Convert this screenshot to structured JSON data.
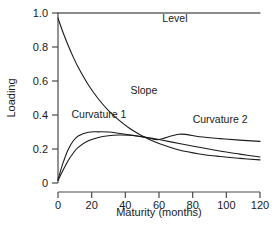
{
  "chart_data": {
    "type": "line",
    "title": "",
    "xlabel": "Maturity (months)",
    "ylabel": "Loading",
    "xlim": [
      0,
      120
    ],
    "ylim": [
      0,
      1.0
    ],
    "xticks": [
      0,
      20,
      40,
      60,
      80,
      100,
      120
    ],
    "xticklabels": [
      "0",
      "20",
      "40",
      "60",
      "80",
      "100",
      "120"
    ],
    "yticks": [
      0,
      0.2,
      0.4,
      0.6,
      0.8,
      1.0
    ],
    "yticklabels": [
      "0",
      "0.2",
      "0.4",
      "0.6",
      "0.8",
      "1.0"
    ],
    "grid": false,
    "legend": "inline-annotations",
    "line_color": "#1a1a1a",
    "x": [
      0,
      3,
      6,
      9,
      12,
      18,
      24,
      30,
      36,
      42,
      48,
      54,
      60,
      72,
      84,
      96,
      108,
      120
    ],
    "series": [
      {
        "name": "Level",
        "label": "Level",
        "label_x": 62,
        "label_y": 0.945,
        "values": [
          1.0,
          1.0,
          1.0,
          1.0,
          1.0,
          1.0,
          1.0,
          1.0,
          1.0,
          1.0,
          1.0,
          1.0,
          1.0,
          1.0,
          1.0,
          1.0,
          1.0,
          1.0
        ]
      },
      {
        "name": "Slope",
        "label": "Slope",
        "label_x": 43,
        "label_y": 0.525,
        "values": [
          0.97,
          0.885,
          0.81,
          0.742,
          0.681,
          0.578,
          0.494,
          0.426,
          0.371,
          0.325,
          0.288,
          0.257,
          0.232,
          0.194,
          0.171,
          0.156,
          0.145,
          0.136
        ]
      },
      {
        "name": "Curvature 1",
        "label": "Curvature 1",
        "label_x": 8,
        "label_y": 0.385,
        "values": [
          0.02,
          0.118,
          0.196,
          0.247,
          0.277,
          0.299,
          0.301,
          0.3,
          0.293,
          0.284,
          0.275,
          0.265,
          0.256,
          0.287,
          0.272,
          0.261,
          0.252,
          0.245
        ]
      },
      {
        "name": "Curvature 2",
        "label": "Curvature 2",
        "label_x": 80,
        "label_y": 0.352,
        "values": [
          0.015,
          0.075,
          0.131,
          0.175,
          0.21,
          0.248,
          0.268,
          0.278,
          0.282,
          0.281,
          0.275,
          0.266,
          0.256,
          0.232,
          0.21,
          0.188,
          0.17,
          0.153
        ]
      }
    ]
  }
}
